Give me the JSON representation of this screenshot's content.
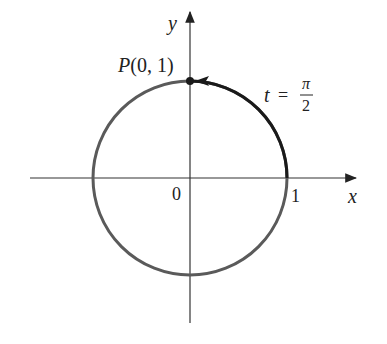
{
  "diagram": {
    "axes": {
      "x_label": "x",
      "y_label": "y"
    },
    "labels": {
      "origin": "0",
      "one": "1",
      "point_P": "P",
      "point_coords": "(0, 1)",
      "t_var": "t",
      "equals": "=",
      "pi": "π",
      "two": "2"
    },
    "colors": {
      "circle": "#5a5a5a",
      "arc": "#1a1a1a",
      "axis": "#333333"
    }
  }
}
